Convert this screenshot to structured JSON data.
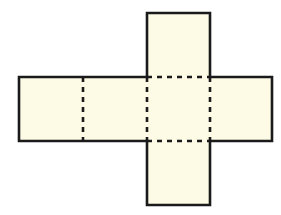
{
  "diagram": {
    "title": "",
    "colors": {
      "fill": "#fdfbe6",
      "stroke": "#1a1a1a",
      "background": "#ffffff"
    },
    "faces": [
      {
        "name": "top",
        "x": 147,
        "y": 13,
        "w": 63,
        "h": 64
      },
      {
        "name": "left",
        "x": 19,
        "y": 77,
        "w": 64,
        "h": 64
      },
      {
        "name": "center-left",
        "x": 83,
        "y": 77,
        "w": 64,
        "h": 64
      },
      {
        "name": "center",
        "x": 147,
        "y": 77,
        "w": 63,
        "h": 64
      },
      {
        "name": "right",
        "x": 210,
        "y": 77,
        "w": 62,
        "h": 64
      },
      {
        "name": "bottom",
        "x": 147,
        "y": 141,
        "w": 63,
        "h": 64
      }
    ],
    "fold_lines": [
      {
        "x1": 83,
        "y1": 77,
        "x2": 83,
        "y2": 141
      },
      {
        "x1": 147,
        "y1": 77,
        "x2": 147,
        "y2": 141
      },
      {
        "x1": 210,
        "y1": 77,
        "x2": 210,
        "y2": 141
      },
      {
        "x1": 147,
        "y1": 77,
        "x2": 210,
        "y2": 77
      },
      {
        "x1": 147,
        "y1": 141,
        "x2": 210,
        "y2": 141
      }
    ]
  }
}
